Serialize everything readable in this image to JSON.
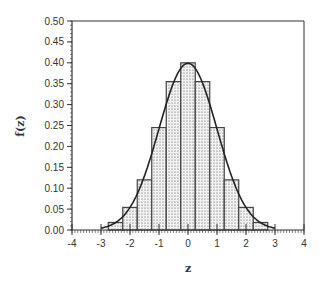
{
  "chart_data": {
    "type": "bar",
    "title": "",
    "xlabel": "z",
    "ylabel": "f(z)",
    "xlim": [
      -4,
      4
    ],
    "ylim": [
      0,
      0.5
    ],
    "x_ticks": [
      "-4",
      "-3",
      "-2",
      "-1",
      "0",
      "1",
      "2",
      "3",
      "4"
    ],
    "y_ticks": [
      "0.00",
      "0.05",
      "0.10",
      "0.15",
      "0.20",
      "0.25",
      "0.30",
      "0.35",
      "0.40",
      "0.45",
      "0.50"
    ],
    "grid": false,
    "legend": null,
    "bar_width": 0.5,
    "categories": [
      -2.5,
      -2.0,
      -1.5,
      -1.0,
      -0.5,
      0.0,
      0.5,
      1.0,
      1.5,
      2.0,
      2.5
    ],
    "values": [
      0.018,
      0.054,
      0.12,
      0.245,
      0.355,
      0.4,
      0.355,
      0.245,
      0.12,
      0.054,
      0.018
    ],
    "overlay_curve": {
      "type": "line",
      "name": "standard normal density",
      "x_range": [
        -3,
        3
      ],
      "formula": "exp(-z^2/2)/sqrt(2*pi)"
    }
  }
}
